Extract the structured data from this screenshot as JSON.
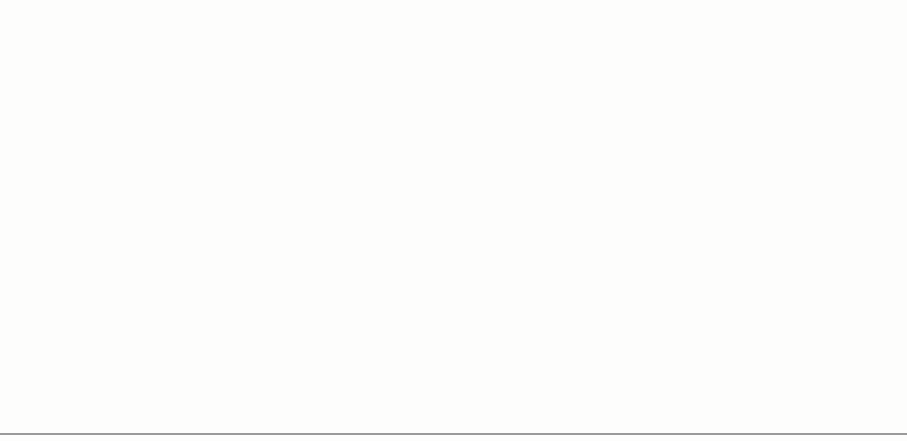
{
  "chart_data": {
    "type": "line",
    "title": "",
    "xlabel": "",
    "ylabel": "PERCENT",
    "xlim": [
      1950,
      1990
    ],
    "grid": false,
    "legend_position": "inline-annotation",
    "broken_axis": true,
    "axis_break_note": "y-axis broken between 12 and 54",
    "y_lower_panel": {
      "range": [
        0,
        12.6
      ],
      "tick_labels": [
        "0",
        "4",
        "8",
        "12"
      ],
      "tick_values": [
        0,
        4,
        8,
        12
      ],
      "minor_tick_step": 1
    },
    "y_upper_panel": {
      "range": [
        53.0,
        61.8
      ],
      "tick_labels": [
        "54",
        "57",
        "60"
      ],
      "tick_values": [
        54,
        57,
        60
      ],
      "minor_tick_step": 1
    },
    "x_tick_labels": [
      "1950",
      "1960",
      "1970",
      "1980",
      "1990"
    ],
    "x_tick_values": [
      1950,
      1960,
      1970,
      1980,
      1990
    ],
    "x_minor_tick_step": 1,
    "x_mid_decade_ticks": [
      1955,
      1965,
      1975,
      1985
    ],
    "x": [
      1950,
      1951,
      1952,
      1953,
      1954,
      1955,
      1956,
      1957,
      1958,
      1959,
      1960,
      1961,
      1962,
      1963,
      1964,
      1965,
      1966,
      1967,
      1968,
      1969,
      1970,
      1971,
      1972,
      1973,
      1974,
      1975,
      1976,
      1977,
      1978,
      1979,
      1980,
      1981,
      1982,
      1983,
      1984,
      1985,
      1986,
      1987,
      1988,
      1989
    ],
    "series": [
      {
        "name": "Employment rate",
        "color": "#6b6b6b",
        "panel": "upper",
        "label_x": 1972.2,
        "label_y": 55.3,
        "values": [
          55.0,
          55.4,
          55.3,
          55.1,
          54.0,
          54.7,
          55.9,
          55.5,
          54.6,
          54.7,
          54.7,
          54.3,
          54.3,
          54.0,
          54.6,
          55.1,
          55.9,
          56.1,
          56.2,
          56.8,
          56.9,
          56.3,
          56.8,
          57.1,
          57.1,
          55.1,
          56.5,
          57.7,
          59.6,
          59.2,
          59.1,
          60.0,
          59.0,
          59.1,
          59.5,
          60.1,
          60.7,
          61.3,
          61.4,
          61.3
        ]
      },
      {
        "name": "Unemployment rate",
        "color": "#181818",
        "panel": "lower",
        "label_x": 1971.3,
        "label_y": 3.2,
        "values": [
          4.7,
          4.2,
          3.6,
          2.9,
          6.0,
          5.0,
          4.0,
          4.1,
          6.8,
          5.1,
          5.2,
          6.7,
          5.3,
          5.6,
          5.9,
          4.9,
          4.0,
          3.9,
          3.6,
          2.9,
          4.5,
          6.6,
          6.3,
          5.3,
          5.7,
          8.8,
          8.1,
          7.8,
          7.0,
          6.1,
          7.7,
          8.6,
          9.4,
          9.4,
          7.3,
          6.9,
          6.7,
          6.2,
          5.7,
          5.9
        ]
      }
    ],
    "annotations": [
      {
        "text": "Employment rate",
        "x": 1972.2,
        "y": 55.3
      },
      {
        "text": "Unemployment rate",
        "x": 1971.3,
        "y": 3.2
      }
    ]
  },
  "axis": {
    "ylabel": "PERCENT",
    "x_labels": [
      "1950",
      "1960",
      "1970",
      "1980",
      "1990"
    ],
    "y_labels_upper": [
      "60",
      "57",
      "54"
    ],
    "y_labels_lower": [
      "12",
      "8",
      "4",
      "0"
    ]
  },
  "labels": {
    "employment": "Employment rate",
    "unemployment": "Unemployment rate"
  },
  "colors": {
    "employment_line": "#6b6b6b",
    "unemployment_line": "#181818",
    "axis": "#1a1a1a",
    "background": "#fdfdfc",
    "page_rule": "#9a9a9a"
  }
}
